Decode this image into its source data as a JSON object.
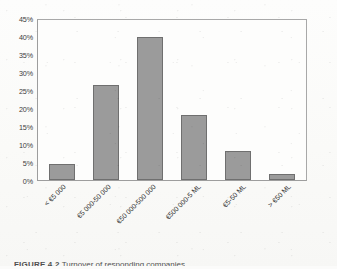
{
  "figure": {
    "caption_number": "FIGURE 4.2",
    "caption_text": "Turnover of responding companies"
  },
  "chart_data": {
    "type": "bar",
    "title": "",
    "xlabel": "",
    "ylabel": "",
    "ylim": [
      0,
      45
    ],
    "ytick_step": 5,
    "grid": false,
    "legend": "none",
    "bar_color": "#9b9b9b",
    "bar_border_color": "#6f6f6f",
    "categories": [
      "< €5 000",
      "€5 000-50 000",
      "€50 000-500 000",
      "€500 000-5 ML",
      "€5-50 ML",
      "> €50 ML"
    ],
    "values": [
      4.6,
      26.5,
      40.0,
      18.2,
      8.2,
      1.6
    ],
    "value_labels": [
      "4.6%",
      "26.5%",
      "40.0%",
      "18.2%",
      "8.2%",
      "1.6%"
    ],
    "ytick_labels": [
      "0%",
      "5%",
      "10%",
      "15%",
      "20%",
      "25%",
      "30%",
      "35%",
      "40%",
      "45%"
    ],
    "ytick_values": [
      0,
      5,
      10,
      15,
      20,
      25,
      30,
      35,
      40,
      45
    ]
  }
}
